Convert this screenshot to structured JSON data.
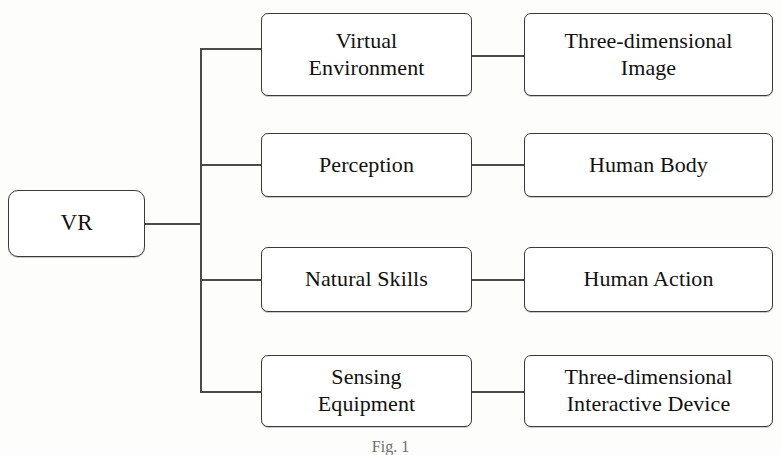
{
  "figure": {
    "type": "horizontal-tree-diagram",
    "caption": "Fig. 1",
    "colors": {
      "background": "#fdfdfc",
      "box_fill": "#ffffff",
      "box_stroke": "#3a3a3a",
      "connector_stroke": "#4a4a4a",
      "text": "#111111"
    }
  },
  "root": {
    "label": "VR"
  },
  "branches": [
    {
      "middle": "Virtual\nEnvironment",
      "right": "Three-dimensional\nImage"
    },
    {
      "middle": "Perception",
      "right": "Human Body"
    },
    {
      "middle": "Natural Skills",
      "right": "Human Action"
    },
    {
      "middle": "Sensing\nEquipment",
      "right": "Three-dimensional\nInteractive Device"
    }
  ]
}
